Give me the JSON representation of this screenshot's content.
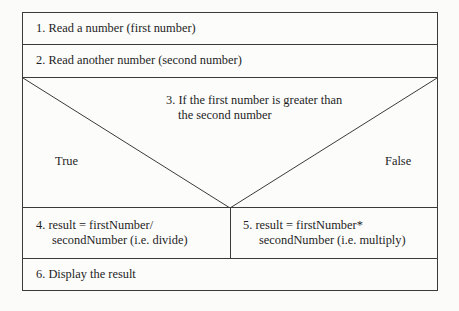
{
  "diagram": {
    "type": "nassi-shneiderman",
    "steps": [
      {
        "id": 1,
        "text": "1. Read a number (first number)"
      },
      {
        "id": 2,
        "text": "2. Read another number (second number)"
      }
    ],
    "condition": {
      "line1": "3. If the first number is greater than",
      "line2": "the second number",
      "true_label": "True",
      "false_label": "False"
    },
    "branches": {
      "true": {
        "line1": "4. result = firstNumber/",
        "line2": "secondNumber (i.e. divide)"
      },
      "false": {
        "line1": "5. result = firstNumber*",
        "line2": "secondNumber (i.e. multiply)"
      }
    },
    "final_step": {
      "id": 6,
      "text": "6. Display the result"
    },
    "colors": {
      "line": "#3a3a3a",
      "text": "#1e1e1e",
      "background": "#fbfbfa"
    }
  }
}
